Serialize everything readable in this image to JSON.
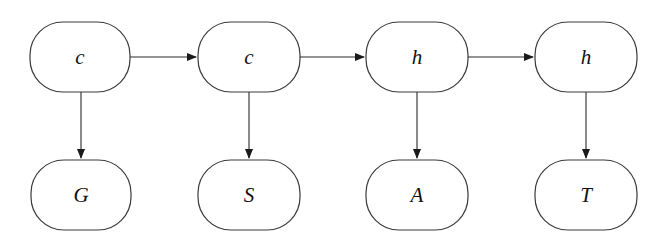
{
  "diagram": {
    "type": "hidden-markov-chain",
    "style": {
      "stroke": "#3a3a3a",
      "text": "#111111",
      "background": "#ffffff"
    },
    "hidden": [
      {
        "id": "h1",
        "label": "c",
        "x": 30,
        "y": 22,
        "w": 100,
        "h": 70
      },
      {
        "id": "h2",
        "label": "c",
        "x": 198,
        "y": 22,
        "w": 102,
        "h": 70
      },
      {
        "id": "h3",
        "label": "h",
        "x": 366,
        "y": 22,
        "w": 102,
        "h": 70
      },
      {
        "id": "h4",
        "label": "h",
        "x": 535,
        "y": 22,
        "w": 102,
        "h": 70
      }
    ],
    "observed": [
      {
        "id": "o1",
        "label": "G",
        "x": 31,
        "y": 160,
        "w": 100,
        "h": 70
      },
      {
        "id": "o2",
        "label": "S",
        "x": 198,
        "y": 160,
        "w": 102,
        "h": 70
      },
      {
        "id": "o3",
        "label": "A",
        "x": 366,
        "y": 160,
        "w": 102,
        "h": 70
      },
      {
        "id": "o4",
        "label": "T",
        "x": 535,
        "y": 160,
        "w": 102,
        "h": 70
      }
    ],
    "edges": [
      {
        "from": "h1",
        "to": "h2"
      },
      {
        "from": "h2",
        "to": "h3"
      },
      {
        "from": "h3",
        "to": "h4"
      },
      {
        "from": "h1",
        "to": "o1"
      },
      {
        "from": "h2",
        "to": "o2"
      },
      {
        "from": "h3",
        "to": "o3"
      },
      {
        "from": "h4",
        "to": "o4"
      }
    ]
  }
}
